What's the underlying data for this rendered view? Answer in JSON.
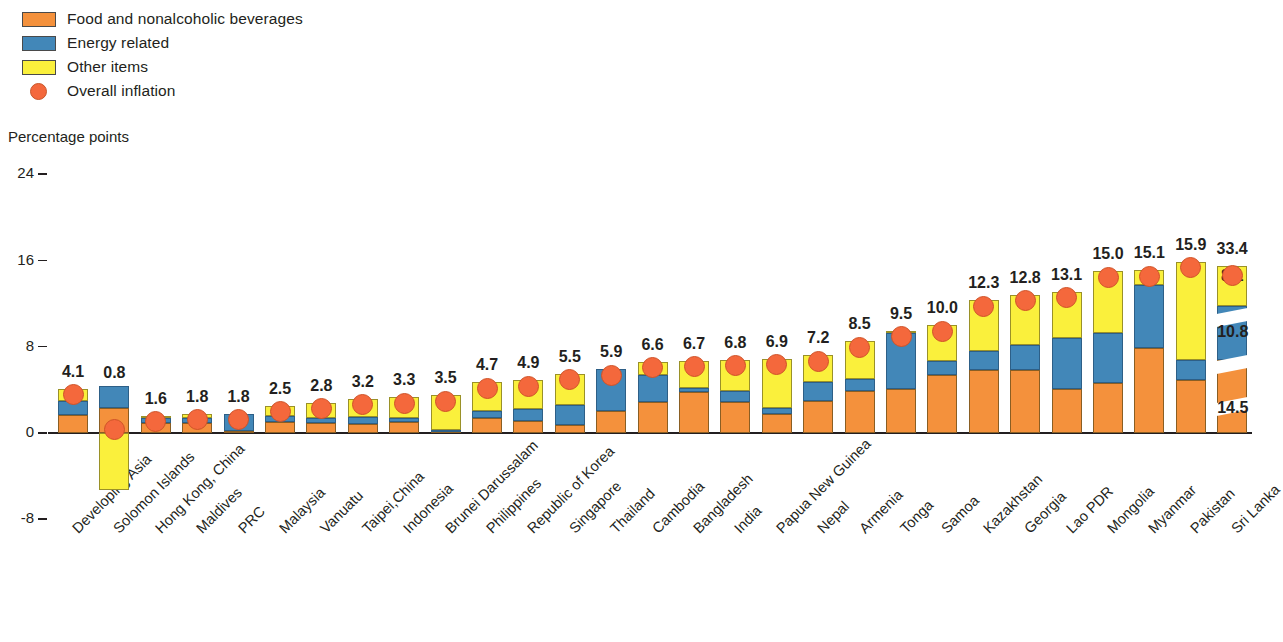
{
  "legend": {
    "items": [
      {
        "label": "Food and nonalcoholic beverages",
        "marker": "square-swatch-orange",
        "color": "#f4913c"
      },
      {
        "label": "Energy related",
        "marker": "square-swatch-blue",
        "color": "#4287b8"
      },
      {
        "label": "Other items",
        "marker": "square-swatch-yellow",
        "color": "#faf03c"
      },
      {
        "label": "Overall inflation",
        "marker": "circle-marker-red",
        "color": "#f4683c"
      }
    ]
  },
  "axis_title": "Percentage points",
  "chart_data": {
    "type": "bar",
    "title": "",
    "subtitle": "",
    "xlabel": "",
    "ylabel": "Percentage points",
    "ylim": [
      -8,
      24
    ],
    "yticks": [
      24,
      16,
      8,
      0,
      -8
    ],
    "ytick_labels": [
      "24",
      "16",
      "8",
      "0",
      "-8"
    ],
    "grid": false,
    "legend_position": "top-left",
    "stacked": true,
    "axis_break_note": "Sri Lanka bar is drawn with an axis break; its segment values are labeled inside the bar.",
    "categories": [
      "Developing Asia",
      "Solomon Islands",
      "Hong Kong, China",
      "Maldives",
      "PRC",
      "Malaysia",
      "Vanuatu",
      "Taipei,China",
      "Indonesia",
      "Brunei Darussalam",
      "Philippines",
      "Republic of Korea",
      "Singapore",
      "Thailand",
      "Cambodia",
      "Bangladesh",
      "India",
      "Papua New Guinea",
      "Nepal",
      "Armenia",
      "Tonga",
      "Samoa",
      "Kazakhstan",
      "Georgia",
      "Lao PDR",
      "Mongolia",
      "Myanmar",
      "Pakistan",
      "Sri Lanka"
    ],
    "series": [
      {
        "name": "Food and nonalcoholic beverages",
        "color": "#f4913c",
        "values": [
          1.7,
          2.3,
          0.9,
          0.9,
          0.2,
          1.0,
          0.9,
          0.8,
          1.0,
          0.2,
          1.4,
          1.1,
          0.7,
          2.0,
          2.9,
          3.8,
          2.9,
          1.8,
          3.0,
          3.9,
          4.1,
          5.4,
          5.8,
          5.8,
          4.1,
          4.6,
          7.9,
          4.9,
          14.5
        ]
      },
      {
        "name": "Energy related",
        "color": "#4287b8",
        "values": [
          1.3,
          2.1,
          0.5,
          0.5,
          1.6,
          0.6,
          0.5,
          0.7,
          0.4,
          0.1,
          0.6,
          1.1,
          1.9,
          3.9,
          2.5,
          0.4,
          1.0,
          0.5,
          1.7,
          1.1,
          5.2,
          1.3,
          1.8,
          2.4,
          4.7,
          4.7,
          5.8,
          1.9,
          10.8
        ]
      },
      {
        "name": "Other items",
        "color": "#faf03c",
        "values": [
          1.1,
          -5.3,
          0.2,
          0.4,
          0.0,
          0.9,
          1.4,
          1.7,
          1.9,
          3.2,
          2.7,
          2.7,
          2.9,
          0.0,
          1.2,
          2.5,
          2.9,
          4.6,
          2.5,
          3.5,
          0.2,
          3.3,
          4.7,
          4.6,
          4.3,
          5.7,
          1.4,
          9.1,
          8.1
        ]
      }
    ],
    "overall_inflation": {
      "name": "Overall inflation",
      "color": "#f4683c",
      "values": [
        4.1,
        0.8,
        1.6,
        1.8,
        1.8,
        2.5,
        2.8,
        3.2,
        3.3,
        3.5,
        4.7,
        4.9,
        5.5,
        5.9,
        6.6,
        6.7,
        6.8,
        6.9,
        7.2,
        8.5,
        9.5,
        10.0,
        12.3,
        12.8,
        13.1,
        15.0,
        15.1,
        15.9,
        33.4
      ]
    },
    "data_labels": [
      "4.1",
      "0.8",
      "1.6",
      "1.8",
      "1.8",
      "2.5",
      "2.8",
      "3.2",
      "3.3",
      "3.5",
      "4.7",
      "4.9",
      "5.5",
      "5.9",
      "6.6",
      "6.7",
      "6.8",
      "6.9",
      "7.2",
      "8.5",
      "9.5",
      "10.0",
      "12.3",
      "12.8",
      "13.1",
      "15.0",
      "15.1",
      "15.9",
      "33.4"
    ],
    "sri_lanka_segment_labels": {
      "other_items": "8.1",
      "energy_related": "10.8",
      "food": "14.5"
    }
  }
}
